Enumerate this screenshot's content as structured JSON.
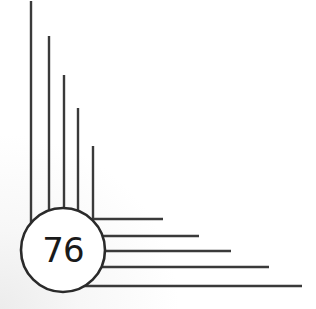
{
  "badge": {
    "number": "76"
  },
  "colors": {
    "line": "#3a3a3a",
    "circle_stroke": "#2a2a2a",
    "circle_fill": "#ffffff",
    "text": "#1a1a1a",
    "background": "#ffffff"
  },
  "vertical_lines": [
    {
      "x": 31,
      "top": 1
    },
    {
      "x": 49,
      "top": 36
    },
    {
      "x": 64,
      "top": 75
    },
    {
      "x": 78,
      "top": 108
    },
    {
      "x": 93,
      "top": 146
    }
  ],
  "horizontal_lines": [
    {
      "y": 219,
      "right": 163
    },
    {
      "y": 236,
      "right": 199
    },
    {
      "y": 251,
      "right": 231
    },
    {
      "y": 267,
      "right": 269
    },
    {
      "y": 286,
      "right": 302
    }
  ]
}
